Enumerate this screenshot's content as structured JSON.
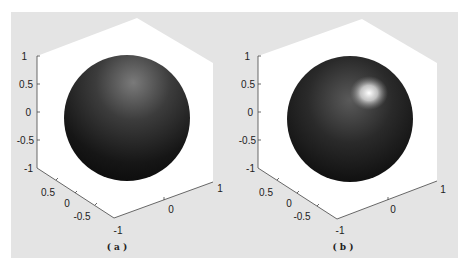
{
  "figure": {
    "panels": [
      {
        "caption": "( a )",
        "lighting": "diffuse, no specular highlight",
        "z_ticks": [
          "1",
          "0.5",
          "0",
          "-0.5",
          "-1"
        ],
        "y_ticks": [
          "0.5",
          "0",
          "-0.5"
        ],
        "x_ticks": [
          "-1",
          "0",
          "1"
        ]
      },
      {
        "caption": "( b )",
        "lighting": "specular highlight upper-right",
        "z_ticks": [
          "1",
          "0.5",
          "0",
          "-0.5",
          "-1"
        ],
        "y_ticks": [
          "0.5",
          "0",
          "-0.5"
        ],
        "x_ticks": [
          "-1",
          "0",
          "1"
        ]
      }
    ],
    "colors": {
      "background": "#e4e4e4",
      "axes_face": "#ffffff",
      "sphere_dark": "#0d0d0d",
      "highlight": "#f5f5f5"
    }
  }
}
